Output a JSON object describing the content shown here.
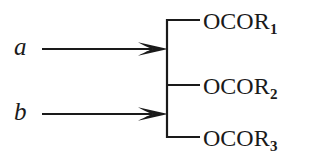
{
  "diagram": {
    "kind": "chemical-reaction-scheme",
    "background_color": "#ffffff",
    "ink_color": "#1a1a1a",
    "reagents": [
      {
        "id": "a",
        "label": "a",
        "style": "italic"
      },
      {
        "id": "b",
        "label": "b",
        "style": "italic"
      }
    ],
    "arrows": [
      {
        "id": "arrow-a",
        "from_label": "a",
        "x1": 42,
        "y1": 49,
        "x2": 168,
        "y2": 49
      },
      {
        "id": "arrow-b",
        "from_label": "b",
        "x1": 42,
        "y1": 114,
        "x2": 168,
        "y2": 114
      }
    ],
    "bracket": {
      "spine_x": 167,
      "top_y": 20,
      "bottom_y": 137,
      "tick_end_x": 200,
      "tick_y": [
        20,
        85,
        137
      ]
    },
    "products": [
      {
        "id": "product-1",
        "base": "OCOR",
        "subscript": "1",
        "full": "OCOR1"
      },
      {
        "id": "product-2",
        "base": "OCOR",
        "subscript": "2",
        "full": "OCOR2"
      },
      {
        "id": "product-3",
        "base": "OCOR",
        "subscript": "3",
        "full": "OCOR3"
      }
    ]
  }
}
